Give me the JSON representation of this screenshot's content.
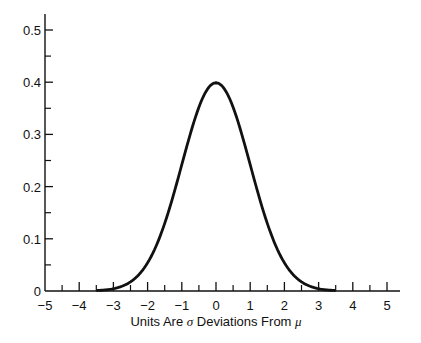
{
  "chart_data": {
    "type": "line",
    "title": "",
    "xlabel": "Units Are σ Deviations From μ",
    "xlabel_parts": {
      "pre": "Units Are ",
      "sigma": "σ",
      "mid": " Deviations From ",
      "mu": "μ"
    },
    "ylabel": "",
    "xlim": [
      -5,
      5.4
    ],
    "ylim": [
      0,
      0.53
    ],
    "grid": false,
    "legend": null,
    "x_ticks": [
      -5,
      -4,
      -3,
      -2,
      -1,
      0,
      1,
      2,
      3,
      4,
      5
    ],
    "x_tick_labels": [
      "−5",
      "−4",
      "−3",
      "−2",
      "−1",
      "0",
      "1",
      "2",
      "3",
      "4",
      "5"
    ],
    "x_minor_ticks": [
      -4.5,
      -3.5,
      -2.5,
      -1.5,
      -0.5,
      0.5,
      1.5,
      2.5,
      3.5,
      4.5
    ],
    "y_ticks": [
      0,
      0.1,
      0.2,
      0.3,
      0.4,
      0.5
    ],
    "y_tick_labels": [
      "0",
      "0.1",
      "0.2",
      "0.3",
      "0.4",
      "0.5"
    ],
    "y_minor_ticks": [
      0.05,
      0.15,
      0.25,
      0.35,
      0.45
    ],
    "series": [
      {
        "name": "Standard normal density",
        "x": [
          -3.5,
          -3,
          -2.5,
          -2,
          -1.5,
          -1,
          -0.5,
          0,
          0.5,
          1,
          1.5,
          2,
          2.5,
          3,
          3.5
        ],
        "values": [
          0.001,
          0.004,
          0.018,
          0.054,
          0.13,
          0.242,
          0.352,
          0.399,
          0.352,
          0.242,
          0.13,
          0.054,
          0.018,
          0.004,
          0.001
        ]
      }
    ]
  },
  "colors": {
    "curve": "#111111",
    "axis": "#111111",
    "background": "#ffffff"
  }
}
